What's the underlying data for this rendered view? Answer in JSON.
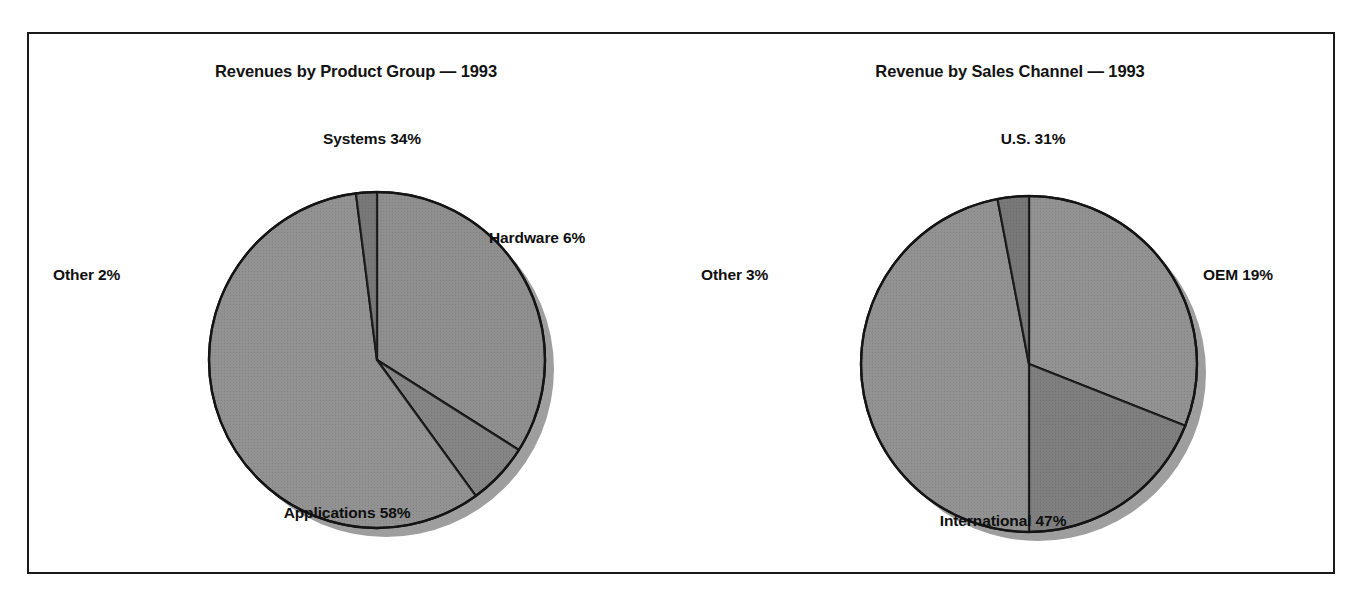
{
  "figure": {
    "background_color": "#ffffff",
    "frame_color": "#1a1a1a"
  },
  "charts": [
    {
      "id": "product-group",
      "title": "Revenues by Product Group — 1993",
      "labels": {
        "systems": "Systems 34%",
        "hardware": "Hardware 6%",
        "applications": "Applications 58%",
        "other": "Other 2%"
      }
    },
    {
      "id": "sales-channel",
      "title": "Revenue by Sales Channel — 1993",
      "labels": {
        "us": "U.S. 31%",
        "oem": "OEM 19%",
        "international": "International 47%",
        "other": "Other 3%"
      }
    }
  ],
  "chart_data": [
    {
      "type": "pie",
      "title": "Revenues by Product Group — 1993",
      "categories": [
        "Systems",
        "Hardware",
        "Applications",
        "Other"
      ],
      "values": [
        34,
        6,
        58,
        2
      ],
      "unit": "percent",
      "labels": [
        "Systems 34%",
        "Hardware 6%",
        "Applications 58%",
        "Other 2%"
      ],
      "slice_colors": [
        "#878787",
        "#7c7c7c",
        "#8a8a8a",
        "#6e6e6e"
      ],
      "slice_order": "clockwise from 12 o'clock",
      "start_angle_deg": 0,
      "legend": "none",
      "grid": false,
      "xlabel": "",
      "ylabel": "",
      "geometry": {
        "center_x": 348,
        "center_y": 326,
        "radius": 168,
        "shadow_offset_x": 9,
        "shadow_offset_y": 9
      }
    },
    {
      "type": "pie",
      "title": "Revenue by Sales Channel — 1993",
      "categories": [
        "U.S.",
        "OEM",
        "International",
        "Other"
      ],
      "values": [
        31,
        19,
        47,
        3
      ],
      "unit": "percent",
      "labels": [
        "U.S. 31%",
        "OEM 19%",
        "International 47%",
        "Other 3%"
      ],
      "slice_colors": [
        "#8a8a8a",
        "#757575",
        "#8a8a8a",
        "#6e6e6e"
      ],
      "slice_order": "clockwise from 12 o'clock",
      "start_angle_deg": 0,
      "legend": "none",
      "grid": false,
      "xlabel": "",
      "ylabel": "",
      "geometry": {
        "center_x": 346,
        "center_y": 330,
        "radius": 168,
        "shadow_offset_x": 9,
        "shadow_offset_y": 9
      }
    }
  ]
}
